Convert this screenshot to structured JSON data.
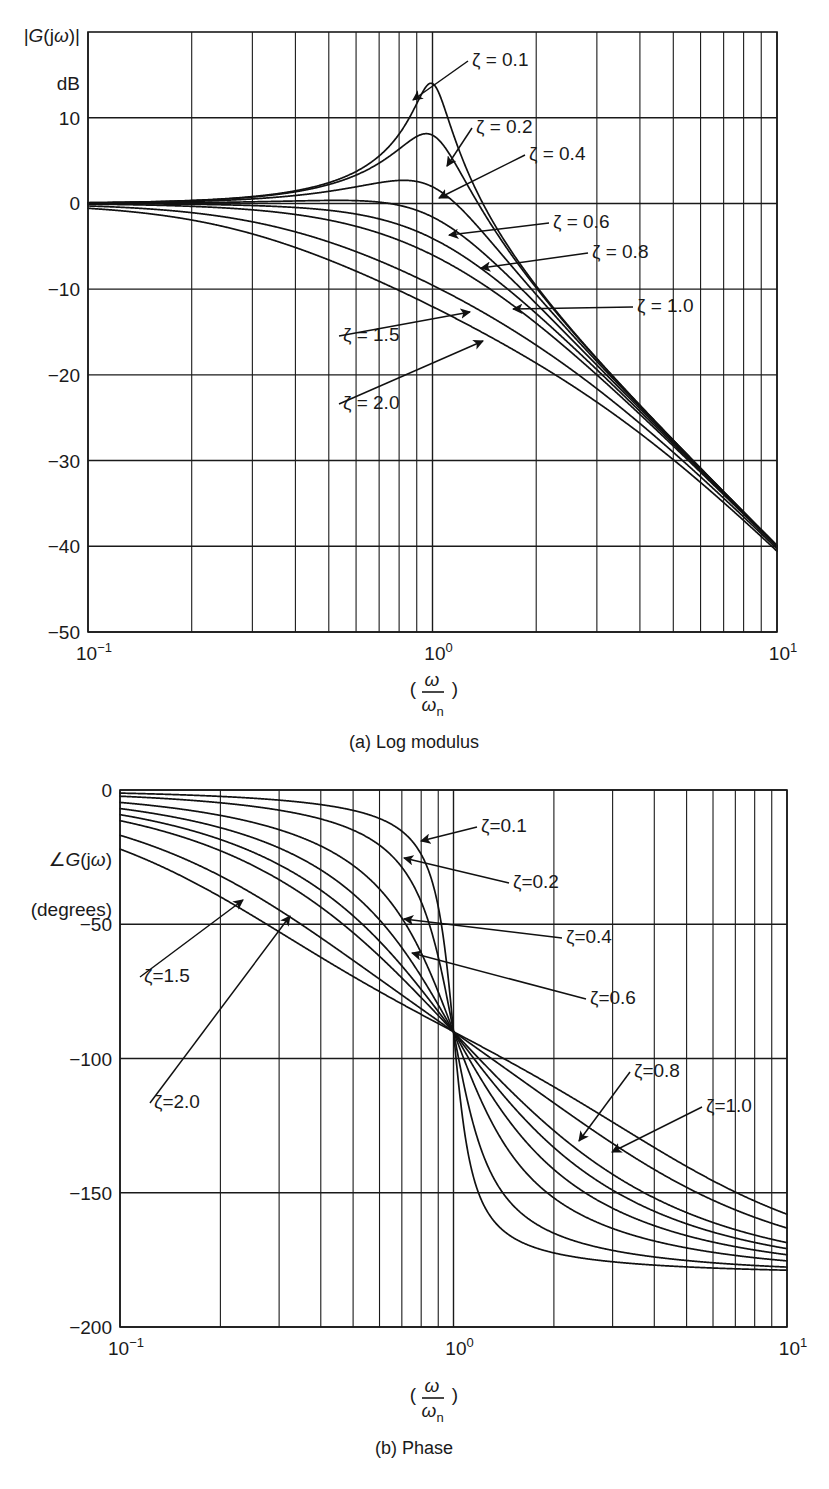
{
  "figure": {
    "background": "#ffffff",
    "ink_color": "#1a1a1a",
    "curve_color": "#111111"
  },
  "panels": [
    {
      "id": "log-modulus",
      "caption": "(a) Log modulus",
      "ylabel_line1": "|G(jω)|",
      "ylabel_line2": "dB",
      "xlabel_numerator": "ω",
      "xlabel_denominator": "ω",
      "xlabel_denominator_sub": "n",
      "yticks": [
        "10",
        "0",
        "−10",
        "−20",
        "−30",
        "−40",
        "−50"
      ],
      "ytick_values": [
        10,
        0,
        -10,
        -20,
        -30,
        -40,
        -50
      ],
      "ylim": [
        -50,
        20
      ],
      "xticks": [
        "10⁻¹",
        "10⁰",
        "10¹"
      ],
      "xtick_values": [
        0.1,
        1,
        10
      ],
      "xlim": [
        0.1,
        10
      ],
      "grid": "logarithmic-minor-decades",
      "zeta_labels": [
        {
          "text": "ζ = 0.1",
          "x": 472,
          "y": 66,
          "arrow_to_x": 413,
          "arrow_to_y": 100
        },
        {
          "text": "ζ = 0.2",
          "x": 476,
          "y": 133,
          "arrow_to_x": 447,
          "arrow_to_y": 166
        },
        {
          "text": "ζ = 0.4",
          "x": 529,
          "y": 160,
          "arrow_to_x": 439,
          "arrow_to_y": 198
        },
        {
          "text": "ζ = 0.6",
          "x": 553,
          "y": 228,
          "arrow_to_x": 449,
          "arrow_to_y": 235
        },
        {
          "text": "ζ = 0.8",
          "x": 592,
          "y": 258,
          "arrow_to_x": 481,
          "arrow_to_y": 268
        },
        {
          "text": "ζ = 1.0",
          "x": 637,
          "y": 312,
          "arrow_to_x": 513,
          "arrow_to_y": 309
        },
        {
          "text": "ζ = 1.5",
          "x": 343,
          "y": 341,
          "arrow_to_x": 470,
          "arrow_to_y": 312
        },
        {
          "text": "ζ = 2.0",
          "x": 343,
          "y": 409,
          "arrow_to_x": 483,
          "arrow_to_y": 341
        }
      ]
    },
    {
      "id": "phase",
      "caption": "(b) Phase",
      "ylabel_line1": "∠G(jω)",
      "ylabel_line2": "(degrees)",
      "xlabel_numerator": "ω",
      "xlabel_denominator": "ω",
      "xlabel_denominator_sub": "n",
      "yticks": [
        "0",
        "−50",
        "−100",
        "−150",
        "−200"
      ],
      "ytick_values": [
        0,
        -50,
        -100,
        -150,
        -200
      ],
      "ylim": [
        -200,
        0
      ],
      "xticks": [
        "10⁻¹",
        "10⁰",
        "10¹"
      ],
      "xtick_values": [
        0.1,
        1,
        10
      ],
      "grid": "logarithmic-minor-decades",
      "zeta_labels": [
        {
          "text": "ζ=0.1",
          "x": 481,
          "y": 832,
          "arrow_to_x": 421,
          "arrow_to_y": 841
        },
        {
          "text": "ζ=0.2",
          "x": 513,
          "y": 888,
          "arrow_to_x": 404,
          "arrow_to_y": 858
        },
        {
          "text": "ζ=0.4",
          "x": 566,
          "y": 943,
          "arrow_to_x": 404,
          "arrow_to_y": 919
        },
        {
          "text": "ζ=0.6",
          "x": 590,
          "y": 1004,
          "arrow_to_x": 412,
          "arrow_to_y": 953
        },
        {
          "text": "ζ=0.8",
          "x": 634,
          "y": 1077,
          "arrow_to_x": 579,
          "arrow_to_y": 1141
        },
        {
          "text": "ζ=1.0",
          "x": 706,
          "y": 1112,
          "arrow_to_x": 612,
          "arrow_to_y": 1152
        },
        {
          "text": "ζ=1.5",
          "x": 144,
          "y": 982,
          "arrow_to_x": 243,
          "arrow_to_y": 900
        },
        {
          "text": "ζ=2.0",
          "x": 154,
          "y": 1108,
          "arrow_to_x": 290,
          "arrow_to_y": 916
        }
      ]
    }
  ],
  "chart_data": {
    "type": "line",
    "subcharts": [
      {
        "name": "log-modulus",
        "title": "(a) Log modulus",
        "xlabel": "(ω/ωn)",
        "ylabel": "|G(jω)| dB",
        "xscale": "log",
        "xlim": [
          0.1,
          10
        ],
        "ylim": [
          -50,
          20
        ],
        "xticks": [
          0.1,
          1,
          10
        ],
        "yticks": [
          10,
          0,
          -10,
          -20,
          -30,
          -40,
          -50
        ],
        "grid": true,
        "legend_position": "inline-annotations",
        "formula": "20*log10(1/sqrt((1-u^2)^2+(2*zeta*u)^2))",
        "series": [
          {
            "name": "ζ = 0.1",
            "zeta": 0.1,
            "peak_db": 14.0,
            "peak_at_u": 0.99,
            "value_at_u1_db": 14.0,
            "value_at_u10_db": -40.0,
            "value_at_u0p1_db": 0.09
          },
          {
            "name": "ζ = 0.2",
            "zeta": 0.2,
            "peak_db": 8.1,
            "peak_at_u": 0.96,
            "value_at_u1_db": 7.96,
            "value_at_u10_db": -40.0,
            "value_at_u0p1_db": 0.08
          },
          {
            "name": "ζ = 0.4",
            "zeta": 0.4,
            "peak_db": 2.7,
            "peak_at_u": 0.82,
            "value_at_u1_db": 1.94,
            "value_at_u10_db": -40.0,
            "value_at_u0p1_db": 0.06
          },
          {
            "name": "ζ = 0.6",
            "zeta": 0.6,
            "peak_db": 0.35,
            "peak_at_u": 0.53,
            "value_at_u1_db": -1.58,
            "value_at_u10_db": -40.0,
            "value_at_u0p1_db": 0.02
          },
          {
            "name": "ζ = 0.8",
            "zeta": 0.8,
            "peak_db": 0.0,
            "peak_at_u": 0.0,
            "value_at_u1_db": -4.08,
            "value_at_u10_db": -40.1,
            "value_at_u0p1_db": -0.03
          },
          {
            "name": "ζ = 1.0",
            "zeta": 1.0,
            "peak_db": 0.0,
            "peak_at_u": 0.0,
            "value_at_u1_db": -6.02,
            "value_at_u10_db": -40.2,
            "value_at_u0p1_db": -0.09
          },
          {
            "name": "ζ = 1.5",
            "zeta": 1.5,
            "peak_db": 0.0,
            "peak_at_u": 0.0,
            "value_at_u1_db": -9.54,
            "value_at_u10_db": -40.4,
            "value_at_u0p1_db": -0.26
          },
          {
            "name": "ζ = 2.0",
            "zeta": 2.0,
            "peak_db": 0.0,
            "peak_at_u": 0.0,
            "value_at_u1_db": -12.04,
            "value_at_u10_db": -40.7,
            "value_at_u0p1_db": -0.47
          }
        ]
      },
      {
        "name": "phase",
        "title": "(b) Phase",
        "xlabel": "(ω/ωn)",
        "ylabel": "∠G(jω) (degrees)",
        "xscale": "log",
        "xlim": [
          0.1,
          10
        ],
        "ylim": [
          -200,
          0
        ],
        "xticks": [
          0.1,
          1,
          10
        ],
        "yticks": [
          0,
          -50,
          -100,
          -150,
          -200
        ],
        "grid": true,
        "legend_position": "inline-annotations",
        "formula": "-atan2(2*zeta*u, 1-u^2) in degrees",
        "series": [
          {
            "name": "ζ=0.1",
            "zeta": 0.1,
            "value_at_u0p1_deg": -1.2,
            "value_at_u1_deg": -90,
            "value_at_u10_deg": -178.8
          },
          {
            "name": "ζ=0.2",
            "zeta": 0.2,
            "value_at_u0p1_deg": -2.3,
            "value_at_u1_deg": -90,
            "value_at_u10_deg": -177.7
          },
          {
            "name": "ζ=0.4",
            "zeta": 0.4,
            "value_at_u0p1_deg": -4.6,
            "value_at_u1_deg": -90,
            "value_at_u10_deg": -175.4
          },
          {
            "name": "ζ=0.6",
            "zeta": 0.6,
            "value_at_u0p1_deg": -6.9,
            "value_at_u1_deg": -90,
            "value_at_u10_deg": -173.1
          },
          {
            "name": "ζ=0.8",
            "zeta": 0.8,
            "value_at_u0p1_deg": -9.2,
            "value_at_u1_deg": -90,
            "value_at_u10_deg": -170.8
          },
          {
            "name": "ζ=1.0",
            "zeta": 1.0,
            "value_at_u0p1_deg": -11.5,
            "value_at_u1_deg": -90,
            "value_at_u10_deg": -168.5
          },
          {
            "name": "ζ=1.5",
            "zeta": 1.5,
            "value_at_u0p1_deg": -17.1,
            "value_at_u1_deg": -90,
            "value_at_u10_deg": -162.9
          },
          {
            "name": "ζ=2.0",
            "zeta": 2.0,
            "value_at_u0p1_deg": -22.0,
            "value_at_u1_deg": -90,
            "value_at_u10_deg": -158.0
          }
        ]
      }
    ]
  },
  "geometry": {
    "top_plot": {
      "left": 88,
      "right": 777,
      "top": 32,
      "bottom": 632
    },
    "bottom_plot": {
      "left": 120,
      "right": 787,
      "top": 790,
      "bottom": 1327
    }
  }
}
